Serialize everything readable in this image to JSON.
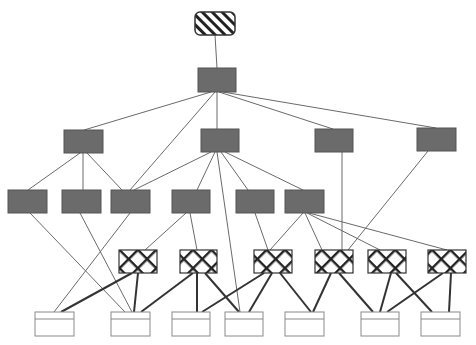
{
  "diagram": {
    "title": "",
    "colors": {
      "background": "#ffffff",
      "filled_node": "#6b6b6b",
      "filled_stroke": "#555555",
      "thin_edge": "#6a6a6a",
      "thick_edge": "#333333",
      "leaf_stroke": "#8a8a8a",
      "hatch": "#222222"
    },
    "nodes": [
      {
        "id": "root",
        "type": "hatched",
        "x": 195,
        "y": 12,
        "w": 40,
        "h": 23
      },
      {
        "id": "L2",
        "type": "filled",
        "x": 198,
        "y": 68,
        "w": 38,
        "h": 24
      },
      {
        "id": "L3a",
        "type": "filled",
        "x": 64,
        "y": 130,
        "w": 39,
        "h": 23
      },
      {
        "id": "L3b",
        "type": "filled",
        "x": 201,
        "y": 129,
        "w": 38,
        "h": 23
      },
      {
        "id": "L3c",
        "type": "filled",
        "x": 315,
        "y": 129,
        "w": 38,
        "h": 23
      },
      {
        "id": "L3d",
        "type": "filled",
        "x": 417,
        "y": 128,
        "w": 39,
        "h": 23
      },
      {
        "id": "L4a",
        "type": "filled",
        "x": 8,
        "y": 190,
        "w": 39,
        "h": 23
      },
      {
        "id": "L4b",
        "type": "filled",
        "x": 62,
        "y": 190,
        "w": 39,
        "h": 23
      },
      {
        "id": "L4c",
        "type": "filled",
        "x": 111,
        "y": 190,
        "w": 39,
        "h": 23
      },
      {
        "id": "L4d",
        "type": "filled",
        "x": 172,
        "y": 190,
        "w": 38,
        "h": 23
      },
      {
        "id": "L4e",
        "type": "filled",
        "x": 236,
        "y": 190,
        "w": 38,
        "h": 23
      },
      {
        "id": "L4f",
        "type": "filled",
        "x": 285,
        "y": 190,
        "w": 39,
        "h": 23
      },
      {
        "id": "X1",
        "type": "crosshatch",
        "x": 119,
        "y": 250,
        "w": 38,
        "h": 23
      },
      {
        "id": "X2",
        "type": "crosshatch",
        "x": 180,
        "y": 250,
        "w": 37,
        "h": 23
      },
      {
        "id": "X3",
        "type": "crosshatch",
        "x": 254,
        "y": 250,
        "w": 38,
        "h": 23
      },
      {
        "id": "X4",
        "type": "crosshatch",
        "x": 315,
        "y": 250,
        "w": 38,
        "h": 23
      },
      {
        "id": "X5",
        "type": "crosshatch",
        "x": 368,
        "y": 250,
        "w": 38,
        "h": 23
      },
      {
        "id": "X6",
        "type": "crosshatch",
        "x": 428,
        "y": 250,
        "w": 38,
        "h": 23
      },
      {
        "id": "B1",
        "type": "leaf",
        "x": 35,
        "y": 312,
        "w": 39,
        "h": 24
      },
      {
        "id": "B2",
        "type": "leaf",
        "x": 111,
        "y": 312,
        "w": 39,
        "h": 24
      },
      {
        "id": "B3",
        "type": "leaf",
        "x": 172,
        "y": 312,
        "w": 38,
        "h": 24
      },
      {
        "id": "B4",
        "type": "leaf",
        "x": 225,
        "y": 312,
        "w": 38,
        "h": 24
      },
      {
        "id": "B5",
        "type": "leaf",
        "x": 285,
        "y": 312,
        "w": 39,
        "h": 24
      },
      {
        "id": "B6",
        "type": "leaf",
        "x": 361,
        "y": 312,
        "w": 38,
        "h": 24
      },
      {
        "id": "B7",
        "type": "leaf",
        "x": 421,
        "y": 312,
        "w": 39,
        "h": 24
      }
    ],
    "edges": [
      {
        "from": "root",
        "to": "L2",
        "x1": 215,
        "y1": 35,
        "x2": 217,
        "y2": 68,
        "w": "thin"
      },
      {
        "from": "L2",
        "to": "L3a",
        "x1": 211,
        "y1": 92,
        "x2": 84,
        "y2": 130,
        "w": "thin"
      },
      {
        "from": "L2",
        "to": "L4c",
        "x1": 215,
        "y1": 92,
        "x2": 130,
        "y2": 190,
        "w": "thin"
      },
      {
        "from": "L2",
        "to": "L3b",
        "x1": 217,
        "y1": 92,
        "x2": 217,
        "y2": 129,
        "w": "thin"
      },
      {
        "from": "L2",
        "to": "L3c",
        "x1": 219,
        "y1": 92,
        "x2": 333,
        "y2": 129,
        "w": "thin"
      },
      {
        "from": "L2",
        "to": "L3d",
        "x1": 223,
        "y1": 92,
        "x2": 436,
        "y2": 128,
        "w": "thin"
      },
      {
        "from": "L3a",
        "to": "L4a",
        "x1": 80,
        "y1": 153,
        "x2": 28,
        "y2": 190,
        "w": "thin"
      },
      {
        "from": "L3a",
        "to": "L4b",
        "x1": 83,
        "y1": 153,
        "x2": 83,
        "y2": 190,
        "w": "thin"
      },
      {
        "from": "L3a",
        "to": "L4c",
        "x1": 87,
        "y1": 153,
        "x2": 122,
        "y2": 190,
        "w": "thin"
      },
      {
        "from": "L3b",
        "to": "L4c",
        "x1": 211,
        "y1": 152,
        "x2": 134,
        "y2": 190,
        "w": "thin"
      },
      {
        "from": "L3b",
        "to": "L4d",
        "x1": 215,
        "y1": 152,
        "x2": 197,
        "y2": 190,
        "w": "thin"
      },
      {
        "from": "L3b",
        "to": "B4",
        "x1": 217,
        "y1": 152,
        "x2": 240,
        "y2": 312,
        "w": "thin"
      },
      {
        "from": "L3b",
        "to": "L4e",
        "x1": 221,
        "y1": 152,
        "x2": 248,
        "y2": 190,
        "w": "thin"
      },
      {
        "from": "L3b",
        "to": "L4f",
        "x1": 225,
        "y1": 152,
        "x2": 303,
        "y2": 190,
        "w": "thin"
      },
      {
        "from": "L3c",
        "to": "X4",
        "x1": 342,
        "y1": 152,
        "x2": 342,
        "y2": 250,
        "w": "thin"
      },
      {
        "from": "L3d",
        "to": "X4",
        "x1": 428,
        "y1": 151,
        "x2": 348,
        "y2": 250,
        "w": "thin"
      },
      {
        "from": "L4a",
        "to": "B2",
        "x1": 30,
        "y1": 213,
        "x2": 125,
        "y2": 312,
        "w": "thin"
      },
      {
        "from": "L4b",
        "to": "B2",
        "x1": 80,
        "y1": 213,
        "x2": 132,
        "y2": 312,
        "w": "thin"
      },
      {
        "from": "L4c",
        "to": "B1",
        "x1": 130,
        "y1": 213,
        "x2": 54,
        "y2": 312,
        "w": "thin"
      },
      {
        "from": "L4d",
        "to": "X1",
        "x1": 186,
        "y1": 213,
        "x2": 145,
        "y2": 250,
        "w": "thin"
      },
      {
        "from": "L4d",
        "to": "X2",
        "x1": 190,
        "y1": 213,
        "x2": 197,
        "y2": 250,
        "w": "thin"
      },
      {
        "from": "L4e",
        "to": "X3",
        "x1": 255,
        "y1": 213,
        "x2": 268,
        "y2": 250,
        "w": "thin"
      },
      {
        "from": "L4f",
        "to": "X3",
        "x1": 303,
        "y1": 213,
        "x2": 270,
        "y2": 250,
        "w": "thin"
      },
      {
        "from": "L4f",
        "to": "X4",
        "x1": 305,
        "y1": 213,
        "x2": 322,
        "y2": 250,
        "w": "thin"
      },
      {
        "from": "L4f",
        "to": "X5",
        "x1": 307,
        "y1": 213,
        "x2": 380,
        "y2": 250,
        "w": "thin"
      },
      {
        "from": "L4f",
        "to": "X6",
        "x1": 309,
        "y1": 213,
        "x2": 447,
        "y2": 250,
        "w": "thin"
      },
      {
        "from": "X1",
        "to": "B1",
        "x1": 132,
        "y1": 273,
        "x2": 61,
        "y2": 312,
        "w": "thick"
      },
      {
        "from": "X1",
        "to": "B2",
        "x1": 138,
        "y1": 273,
        "x2": 134,
        "y2": 312,
        "w": "thick"
      },
      {
        "from": "X2",
        "to": "B2",
        "x1": 193,
        "y1": 273,
        "x2": 141,
        "y2": 312,
        "w": "thick"
      },
      {
        "from": "X2",
        "to": "B3",
        "x1": 197,
        "y1": 273,
        "x2": 197,
        "y2": 312,
        "w": "thick"
      },
      {
        "from": "X2",
        "to": "B4",
        "x1": 205,
        "y1": 273,
        "x2": 239,
        "y2": 312,
        "w": "thick"
      },
      {
        "from": "X3",
        "to": "B3",
        "x1": 264,
        "y1": 273,
        "x2": 202,
        "y2": 312,
        "w": "thick"
      },
      {
        "from": "X3",
        "to": "B4",
        "x1": 272,
        "y1": 273,
        "x2": 249,
        "y2": 312,
        "w": "thick"
      },
      {
        "from": "X3",
        "to": "B5",
        "x1": 280,
        "y1": 273,
        "x2": 311,
        "y2": 312,
        "w": "thick"
      },
      {
        "from": "X4",
        "to": "B5",
        "x1": 331,
        "y1": 273,
        "x2": 313,
        "y2": 312,
        "w": "thick"
      },
      {
        "from": "X4",
        "to": "B6",
        "x1": 339,
        "y1": 273,
        "x2": 373,
        "y2": 312,
        "w": "thick"
      },
      {
        "from": "X5",
        "to": "B6",
        "x1": 391,
        "y1": 273,
        "x2": 380,
        "y2": 312,
        "w": "thick"
      },
      {
        "from": "X5",
        "to": "B7",
        "x1": 396,
        "y1": 273,
        "x2": 432,
        "y2": 312,
        "w": "thick"
      },
      {
        "from": "X6",
        "to": "B6",
        "x1": 443,
        "y1": 273,
        "x2": 387,
        "y2": 312,
        "w": "thick"
      },
      {
        "from": "X6",
        "to": "B7",
        "x1": 451,
        "y1": 273,
        "x2": 449,
        "y2": 312,
        "w": "thick"
      }
    ]
  }
}
